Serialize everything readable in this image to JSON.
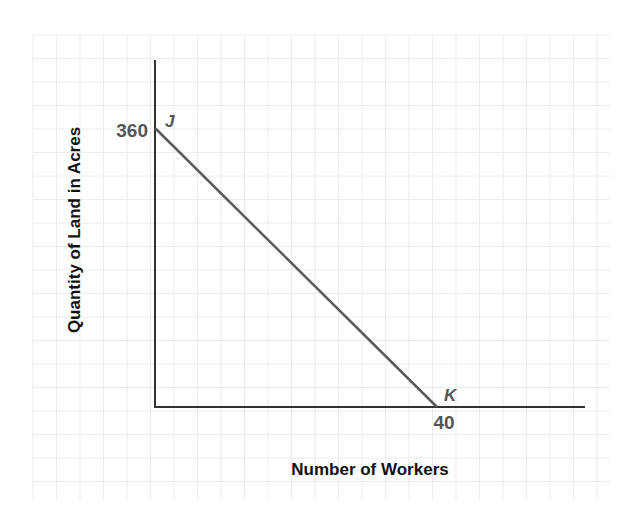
{
  "chart_data": {
    "type": "line",
    "title": "",
    "xlabel": "Number of Workers",
    "ylabel": "Quantity of Land in Acres",
    "grid": true,
    "legend": null,
    "series": [
      {
        "name": "JK",
        "points": [
          {
            "x": 0,
            "y": 360,
            "label": "J"
          },
          {
            "x": 40,
            "y": 0,
            "label": "K"
          }
        ]
      }
    ],
    "annotations": {
      "y_intercept_label": "360",
      "x_intercept_label": "40",
      "point_j": "J",
      "point_k": "K"
    }
  },
  "labels": {
    "x_axis_title": "Number of Workers",
    "y_axis_title": "Quantity of Land in Acres",
    "y_tick": "360",
    "x_tick": "40",
    "point_j": "J",
    "point_k": "K"
  },
  "colors": {
    "grid": "#ececec",
    "axis": "#333333",
    "line": "#5a5a5a",
    "tick_label": "#555555",
    "axis_title": "#111111"
  }
}
